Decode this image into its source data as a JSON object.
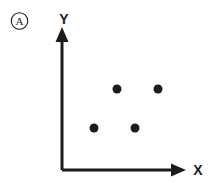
{
  "figure": {
    "panel_label": "A",
    "panel_label_name": "panel-badge-a"
  },
  "chart_data": {
    "type": "scatter",
    "title": "",
    "subtitle": "",
    "xlabel": "X",
    "ylabel": "Y",
    "panel_label": "A",
    "grid": false,
    "legend": null,
    "axis_style": "arrow-headed open axes, no tick marks, no tick labels",
    "xlim": [
      0,
      1
    ],
    "ylim": [
      0,
      1
    ],
    "xticks": [],
    "yticks": [],
    "xticklabels": [],
    "yticklabels": [],
    "series": [
      {
        "name": "points",
        "marker": "circle",
        "marker_color": "#1c1c1c",
        "marker_size_px": 9,
        "points": [
          {
            "label": "upper-left",
            "x": 0.4,
            "y": 0.74,
            "px": 117,
            "py": 89
          },
          {
            "label": "upper-right",
            "x": 0.69,
            "y": 0.74,
            "px": 158,
            "py": 89
          },
          {
            "label": "lower-left",
            "x": 0.23,
            "y": 0.38,
            "px": 94,
            "py": 128
          },
          {
            "label": "lower-right",
            "x": 0.52,
            "y": 0.38,
            "px": 135,
            "py": 128
          }
        ]
      }
    ],
    "annotations": []
  },
  "colors": {
    "ink": "#1c1c1c",
    "background": "#ffffff"
  }
}
